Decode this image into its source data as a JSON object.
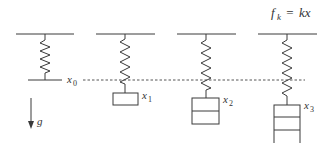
{
  "formula": {
    "lhs": "f",
    "lhs_sub": "k",
    "eq": " = ",
    "rhs": "kx"
  },
  "reference_line_label": {
    "var": "x",
    "sub": "0"
  },
  "gravity_label": "g",
  "springs": [
    {
      "id": 0,
      "label_var": "x",
      "label_sub": "0",
      "mass_blocks": 0
    },
    {
      "id": 1,
      "label_var": "x",
      "label_sub": "1",
      "mass_blocks": 1
    },
    {
      "id": 2,
      "label_var": "x",
      "label_sub": "2",
      "mass_blocks": 2
    },
    {
      "id": 3,
      "label_var": "x",
      "label_sub": "3",
      "mass_blocks": 3
    }
  ],
  "colors": {
    "ink": "#3a3a3a",
    "dashed_line": "#555555",
    "background": "#ffffff"
  }
}
